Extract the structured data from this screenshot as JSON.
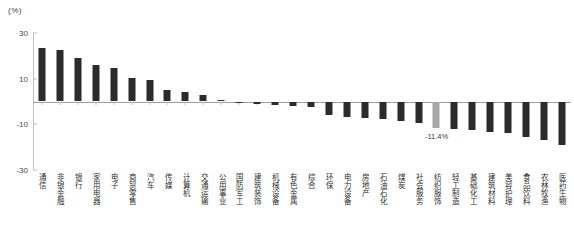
{
  "chart_data": {
    "type": "bar",
    "title": "",
    "subtitle": "",
    "xlabel": "",
    "ylabel": "(%)",
    "unit_label": "(%)",
    "ylim": [
      -30,
      30
    ],
    "yticks": [
      30,
      10,
      -10,
      -30
    ],
    "ytick_labels": [
      "30",
      "10",
      "-10",
      "-30"
    ],
    "grid": false,
    "legend": null,
    "orientation": "vertical",
    "bar_color": "#2b2b2b",
    "highlight_color": "#a8a8a8",
    "categories": [
      "通信",
      "非银金融",
      "银行",
      "家用电器",
      "电子",
      "商贸零售",
      "汽车",
      "传媒",
      "计算机",
      "交通运输",
      "公用事业",
      "国防军工",
      "建筑装饰",
      "机械设备",
      "有色金属",
      "综合",
      "农林牧渔",
      "电力设备",
      "房地产",
      "石油石化",
      "煤炭",
      "社会服务",
      "纺织服饰",
      "轻工制造",
      "基础化工",
      "建筑材料",
      "美容护理",
      "食品饮料",
      "农林牧渔2",
      "医药生物"
    ],
    "category_labels": [
      "通信",
      "非银金融",
      "银行",
      "家用电器",
      "电子",
      "商贸零售",
      "汽车",
      "传媒",
      "计算机",
      "交通运输",
      "公用事业",
      "国防军工",
      "建筑装饰",
      "机械设备",
      "有色金属",
      "综合",
      "环保",
      "电力设备",
      "房地产",
      "石油石化",
      "煤炭",
      "社会服务",
      "纺织服饰",
      "轻工制造",
      "基础化工",
      "建筑材料",
      "美容护理",
      "食品饮料",
      "农林牧渔",
      "医药生物"
    ],
    "values": [
      23.5,
      22.6,
      19.0,
      16.2,
      14.8,
      10.2,
      9.5,
      5.0,
      4.3,
      3.0,
      0.6,
      -0.4,
      -0.9,
      -1.4,
      -2.0,
      -2.6,
      -6.0,
      -6.6,
      -7.2,
      -7.8,
      -8.4,
      -9.2,
      -11.4,
      -12.0,
      -12.6,
      -13.2,
      -13.8,
      -15.6,
      -16.8,
      -19.0
    ],
    "highlight_index": 22,
    "annotations": [
      {
        "index": 22,
        "text": "-11.4%",
        "value": -11.4
      }
    ]
  }
}
